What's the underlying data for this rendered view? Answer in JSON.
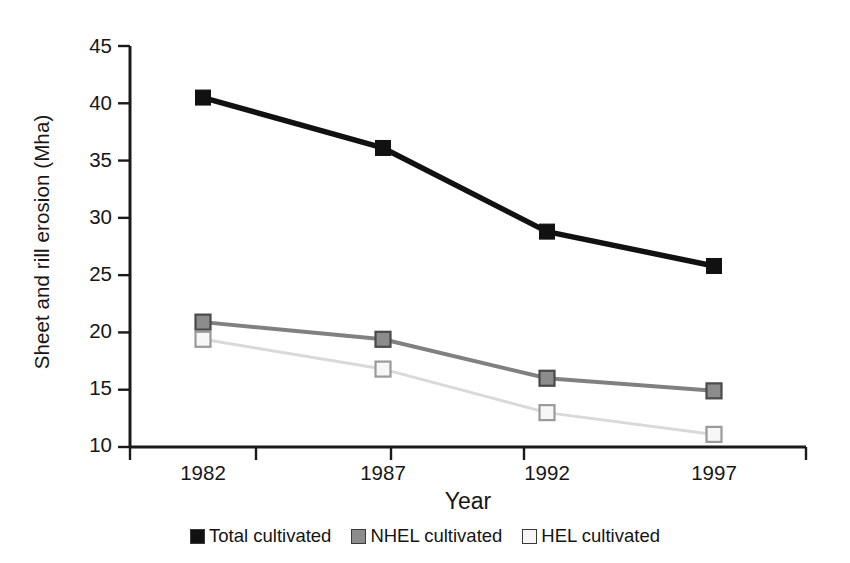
{
  "chart_data": {
    "type": "line",
    "title": "",
    "subtitle": "",
    "xlabel": "Year",
    "ylabel": "Sheet and rill erosion (Mha)",
    "categories": [
      "1982",
      "1987",
      "1992",
      "1997"
    ],
    "x": [
      1982,
      1987,
      1992,
      1997
    ],
    "ylim": [
      10,
      45
    ],
    "yticks": [
      10,
      15,
      20,
      25,
      30,
      35,
      40,
      45
    ],
    "ytick_labels": [
      "10",
      "15",
      "20",
      "25",
      "30",
      "35",
      "40",
      "45"
    ],
    "grid": false,
    "legend_position": "bottom-center",
    "series": [
      {
        "name": "Total cultivated",
        "values": [
          40.5,
          36.1,
          28.8,
          25.8
        ],
        "color": "#111111",
        "marker": "filled-square",
        "line_style": "solid"
      },
      {
        "name": "NHEL cultivated",
        "values": [
          20.9,
          19.4,
          16.0,
          14.9
        ],
        "color": "#808080",
        "marker": "gray-square",
        "line_style": "solid"
      },
      {
        "name": "HEL cultivated",
        "values": [
          19.4,
          16.8,
          13.0,
          11.1
        ],
        "color": "#d9d9d9",
        "marker": "open-square",
        "line_style": "solid"
      }
    ]
  },
  "axes": {
    "y_title": "Sheet and rill erosion (Mha)",
    "x_title": "Year",
    "y_tick_labels": [
      "45",
      "40",
      "35",
      "30",
      "25",
      "20",
      "15",
      "10"
    ],
    "x_tick_labels": [
      "1982",
      "1987",
      "1992",
      "1997"
    ]
  },
  "legend": {
    "items": [
      {
        "label": "Total cultivated",
        "color": "#111111"
      },
      {
        "label": "NHEL cultivated",
        "color": "#8c8c8c"
      },
      {
        "label": "HEL cultivated",
        "color": "#f2f2f2"
      }
    ]
  },
  "colors": {
    "background": "#ffffff",
    "axis": "#1a1a1a",
    "total_cultivated": "#111111",
    "nhel_cultivated": "#808080",
    "hel_cultivated": "#d9d9d9"
  }
}
